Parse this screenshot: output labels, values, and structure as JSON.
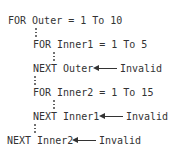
{
  "lines": [
    {
      "text": "FOR Outer = 1 To 10"
    },
    {
      "text": "FOR Inner1 = 1 To 5"
    },
    {
      "text": "NEXT Outer"
    },
    {
      "text": "FOR Inner2 = 1 To 15"
    },
    {
      "text": "NEXT Inner1"
    },
    {
      "text": "NEXT Inner2"
    }
  ],
  "annotations": [
    {
      "label": "Invalid",
      "points_to": "NEXT Outer"
    },
    {
      "label": "Invalid",
      "points_to": "NEXT Inner1"
    },
    {
      "label": "Invalid",
      "points_to": "NEXT Inner2"
    }
  ]
}
